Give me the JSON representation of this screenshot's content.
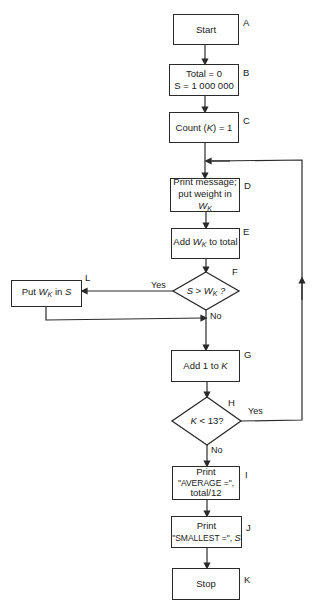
{
  "nodes": [
    {
      "id": "A",
      "type": "terminal",
      "text": "Start"
    },
    {
      "id": "B",
      "type": "process",
      "lines": [
        "Total = 0",
        "S = 1 000 000"
      ]
    },
    {
      "id": "C",
      "type": "process",
      "text": "Count (K) = 1"
    },
    {
      "id": "D",
      "type": "process",
      "lines": [
        "Print message;",
        "put weight in W_K"
      ]
    },
    {
      "id": "E",
      "type": "process",
      "text": "Add W_K to total"
    },
    {
      "id": "F",
      "type": "decision",
      "text": "S > W_K ?"
    },
    {
      "id": "L",
      "type": "process",
      "text": "Put W_K in S"
    },
    {
      "id": "G",
      "type": "process",
      "text": "Add 1 to K"
    },
    {
      "id": "H",
      "type": "decision",
      "text": "K < 13?"
    },
    {
      "id": "I",
      "type": "process",
      "lines": [
        "Print",
        "\"AVERAGE =\",",
        "total/12"
      ]
    },
    {
      "id": "J",
      "type": "process",
      "lines": [
        "Print",
        "\"SMALLEST =\", S"
      ]
    },
    {
      "id": "K",
      "type": "terminal",
      "text": "Stop"
    }
  ],
  "text": {
    "A": "Start",
    "B1": "Total = 0",
    "B2": "S = 1 000 000",
    "C_pre": "Count (",
    "C_var": "K",
    "C_post": ") = 1",
    "D1": "Print message;",
    "D2_pre": "put weight in ",
    "E_pre": "Add ",
    "E_post": " to total",
    "F_pre": "S > ",
    "F_post": " ?",
    "L_pre": "Put ",
    "L_post": " in ",
    "L_var": "S",
    "G_pre": "Add 1 to ",
    "G_var": "K",
    "H_var": "K",
    "H_post": " < 13?",
    "I1": "Print",
    "I2": "\"AVERAGE =\",",
    "I3": "total/12",
    "J1": "Print",
    "J2_pre": "\"SMALLEST =\", ",
    "J2_var": "S",
    "K": "Stop",
    "W": "W",
    "Ksub": "K"
  },
  "node_labels": {
    "A": "A",
    "B": "B",
    "C": "C",
    "D": "D",
    "E": "E",
    "F": "F",
    "G": "G",
    "H": "H",
    "I": "I",
    "J": "J",
    "K": "K",
    "L": "L"
  },
  "edges": [
    {
      "from": "A",
      "to": "B"
    },
    {
      "from": "B",
      "to": "C"
    },
    {
      "from": "C",
      "to": "D"
    },
    {
      "from": "D",
      "to": "E"
    },
    {
      "from": "E",
      "to": "F"
    },
    {
      "from": "F",
      "to": "L",
      "label": "Yes"
    },
    {
      "from": "F",
      "to": "G",
      "label": "No"
    },
    {
      "from": "L",
      "to": "G"
    },
    {
      "from": "G",
      "to": "H"
    },
    {
      "from": "H",
      "to": "D",
      "label": "Yes"
    },
    {
      "from": "H",
      "to": "I",
      "label": "No"
    },
    {
      "from": "I",
      "to": "J"
    },
    {
      "from": "J",
      "to": "K"
    }
  ],
  "edge_labels": {
    "F_yes": "Yes",
    "F_no": "No",
    "H_yes": "Yes",
    "H_no": "No"
  },
  "colors": {
    "line": "#2a2a2a",
    "background": "#ffffff"
  }
}
